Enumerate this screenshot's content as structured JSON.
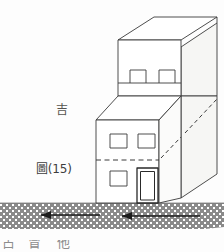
{
  "figure": {
    "caption": "圖(15)",
    "annotation": "吉",
    "page_background": "#fdfdfd",
    "ink_color": "#3a3a3a",
    "shade_color": "#f4f4f2",
    "ground_color": "#8a8a8a",
    "ground_dot_color": "#ffffff"
  },
  "building": {
    "description": "two-story stepped box in axonometric projection",
    "upper_block": {
      "windows": 2,
      "window_style": "open-bottom rectangle"
    },
    "lower_block": {
      "upper_row_windows": 2,
      "lower_row_windows": 1,
      "doors": 1,
      "dashed_divider": true
    },
    "side_face_dashed_lines": 2
  },
  "ground": {
    "texture": "stippled-dot-fill",
    "arrows": [
      {
        "name": "left-arrow-outer",
        "direction": "left"
      },
      {
        "name": "left-arrow-inner",
        "direction": "left"
      }
    ]
  },
  "bottom_text": {
    "glyphs": [
      "占",
      "冒",
      "他"
    ],
    "note": "partially cropped character tops at page bottom"
  }
}
